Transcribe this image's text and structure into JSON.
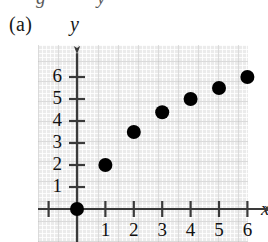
{
  "figure": {
    "part_label": "(a)",
    "top_cut_text": "g   y",
    "background_color": "#ebebeb",
    "point_color": "#000000",
    "axis_color": "#3a3a3a"
  },
  "chart_data": {
    "type": "scatter",
    "title": "(a)",
    "xlabel": "x",
    "ylabel": "y",
    "xlim": [
      -1.6,
      7.0
    ],
    "ylim": [
      -0.9,
      6.9
    ],
    "grid": true,
    "legend": "none",
    "x_ticks": [
      1,
      2,
      3,
      4,
      5,
      6
    ],
    "x_tick_labels": [
      "1",
      "2",
      "3",
      "4",
      "5",
      "6"
    ],
    "x_unlabeled_ticks": [
      -1
    ],
    "y_ticks": [
      1,
      2,
      3,
      4,
      5,
      6
    ],
    "y_tick_labels": [
      "1",
      "2",
      "3",
      "4",
      "5",
      "6"
    ],
    "points": [
      {
        "x": 0,
        "y": 0
      },
      {
        "x": 1,
        "y": 2
      },
      {
        "x": 2,
        "y": 3.5
      },
      {
        "x": 3,
        "y": 4.4
      },
      {
        "x": 4,
        "y": 5
      },
      {
        "x": 5,
        "y": 5.5
      },
      {
        "x": 6,
        "y": 6
      }
    ],
    "point_radius_px": 7
  }
}
